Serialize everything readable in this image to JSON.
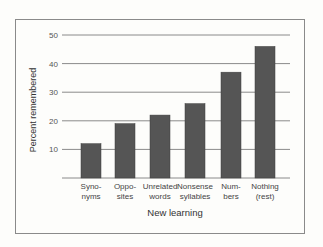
{
  "chart_data": {
    "type": "bar",
    "title": "",
    "xlabel": "New learning",
    "ylabel": "Percent remembered",
    "categories": [
      "Synonyms",
      "Opposites",
      "Unrelated words",
      "Nonsense syllables",
      "Numbers",
      "Nothing (rest)"
    ],
    "category_label_lines": [
      [
        "Syno-",
        "nyms"
      ],
      [
        "Oppo-",
        "sites"
      ],
      [
        "Unrelated",
        "words"
      ],
      [
        "Nonsense",
        "syllables"
      ],
      [
        "Num-",
        "bers"
      ],
      [
        "Nothing",
        "(rest)"
      ]
    ],
    "values": [
      12,
      19,
      22,
      26,
      37,
      46
    ],
    "ylim": [
      0,
      50
    ],
    "yticks": [
      10,
      20,
      30,
      40,
      50
    ],
    "grid": true,
    "legend": null,
    "bar_color": "#555555",
    "grid_color": "#8a8a8a"
  }
}
